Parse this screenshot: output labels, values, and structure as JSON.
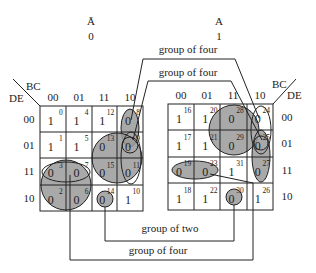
{
  "maps": [
    {
      "id": "left",
      "var_label": "Ā",
      "var_value": "0",
      "col_var": "BC",
      "row_var": "DE",
      "col_labels": [
        "00",
        "01",
        "11",
        "10"
      ],
      "row_labels": [
        "00",
        "01",
        "11",
        "10"
      ],
      "cells": [
        [
          {
            "v": "1",
            "i": "0"
          },
          {
            "v": "1",
            "i": "4"
          },
          {
            "v": "1",
            "i": "12"
          },
          {
            "v": "0",
            "i": "8"
          }
        ],
        [
          {
            "v": "1",
            "i": "1"
          },
          {
            "v": "1",
            "i": "5"
          },
          {
            "v": "0",
            "i": "13"
          },
          {
            "v": "0",
            "i": "9"
          }
        ],
        [
          {
            "v": "0",
            "i": "3"
          },
          {
            "v": "0",
            "i": "7"
          },
          {
            "v": "0",
            "i": "15"
          },
          {
            "v": "0",
            "i": "11"
          }
        ],
        [
          {
            "v": "0",
            "i": "2"
          },
          {
            "v": "0",
            "i": "6"
          },
          {
            "v": "0",
            "i": "14"
          },
          {
            "v": "1",
            "i": "10"
          }
        ]
      ]
    },
    {
      "id": "right",
      "var_label": "A",
      "var_value": "1",
      "col_var": "BC",
      "row_var": "DE",
      "col_labels": [
        "00",
        "01",
        "11",
        "10"
      ],
      "row_labels": [
        "00",
        "01",
        "11",
        "10"
      ],
      "cells": [
        [
          {
            "v": "1",
            "i": "16"
          },
          {
            "v": "1",
            "i": "20"
          },
          {
            "v": "0",
            "i": "28"
          },
          {
            "v": "0",
            "i": "24"
          }
        ],
        [
          {
            "v": "1",
            "i": "17"
          },
          {
            "v": "1",
            "i": "21"
          },
          {
            "v": "0",
            "i": "29"
          },
          {
            "v": "0",
            "i": "25"
          }
        ],
        [
          {
            "v": "0",
            "i": "19"
          },
          {
            "v": "0",
            "i": "23"
          },
          {
            "v": "1",
            "i": "31"
          },
          {
            "v": "0",
            "i": "27"
          }
        ],
        [
          {
            "v": "1",
            "i": "18"
          },
          {
            "v": "1",
            "i": "22"
          },
          {
            "v": "0",
            "i": "30"
          },
          {
            "v": "1",
            "i": "26"
          }
        ]
      ]
    }
  ],
  "annotations": {
    "top_group_1": "group of four",
    "top_group_2": "group of four",
    "bottom_group_1": "group of two",
    "bottom_group_2": "group of four"
  },
  "colors": {
    "group_fill": "#9a9a9a",
    "line": "#222222"
  }
}
